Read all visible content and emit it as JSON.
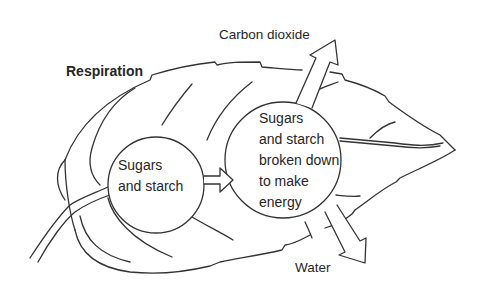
{
  "diagram": {
    "title": "Respiration",
    "colors": {
      "stroke": "#333333",
      "text": "#262626",
      "background": "#ffffff"
    },
    "nodes": [
      {
        "id": "input",
        "lines": [
          "Sugars",
          "and starch"
        ]
      },
      {
        "id": "process",
        "lines": [
          "Sugars",
          "and starch",
          "broken down",
          "to make",
          "energy"
        ]
      }
    ],
    "arrows": [
      {
        "from": "input",
        "to": "process",
        "type": "hollow-arrow"
      },
      {
        "from": "process",
        "to": "outside",
        "label": "Carbon dioxide",
        "direction": "up-right"
      },
      {
        "from": "process",
        "to": "outside",
        "label": "Water",
        "direction": "down-right"
      }
    ],
    "outputs": {
      "carbon_dioxide": "Carbon dioxide",
      "water": "Water"
    },
    "background_shape": "leaf"
  }
}
